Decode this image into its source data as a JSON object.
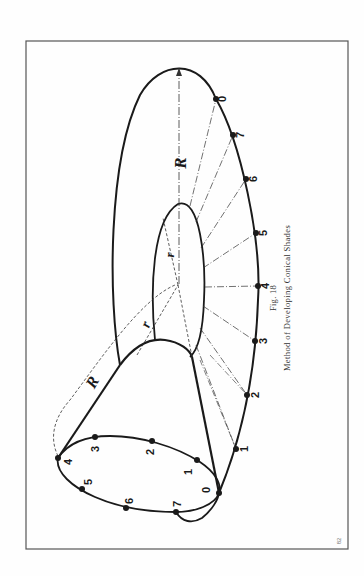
{
  "figure": {
    "label": "Fig. 18",
    "title": "Method of Developing Conical Shades",
    "page_number": "82"
  },
  "labels": {
    "R_large": "R",
    "R_slant": "R",
    "r_small": "r",
    "r_inner": "r"
  },
  "outer_points": [
    {
      "label": "0",
      "x": 216,
      "y": 99
    },
    {
      "label": "7",
      "x": 233,
      "y": 135
    },
    {
      "label": "6",
      "x": 246,
      "y": 179
    },
    {
      "label": "5",
      "x": 256,
      "y": 233
    },
    {
      "label": "4",
      "x": 258,
      "y": 286
    },
    {
      "label": "3",
      "x": 255,
      "y": 341
    },
    {
      "label": "2",
      "x": 247,
      "y": 395
    },
    {
      "label": "1",
      "x": 236,
      "y": 449
    }
  ],
  "base_points": [
    {
      "label": "0",
      "x": 219,
      "y": 493
    },
    {
      "label": "1",
      "x": 197,
      "y": 460
    },
    {
      "label": "2",
      "x": 152,
      "y": 441
    },
    {
      "label": "3",
      "x": 95,
      "y": 437
    },
    {
      "label": "4",
      "x": 58,
      "y": 458
    },
    {
      "label": "5",
      "x": 82,
      "y": 489
    },
    {
      "label": "6",
      "x": 126,
      "y": 508
    },
    {
      "label": "7",
      "x": 176,
      "y": 512
    }
  ],
  "colors": {
    "ink": "#1a1a1a",
    "frame": "#555555",
    "paper": "#fefefe"
  }
}
